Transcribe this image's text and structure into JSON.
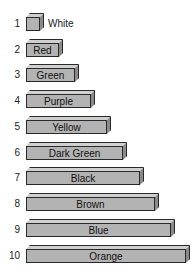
{
  "figure": {
    "items": [
      {
        "num": "1",
        "label": "White",
        "length_units": 1
      },
      {
        "num": "2",
        "label": "Red",
        "length_units": 2
      },
      {
        "num": "3",
        "label": "Green",
        "length_units": 3
      },
      {
        "num": "4",
        "label": "Purple",
        "length_units": 4
      },
      {
        "num": "5",
        "label": "Yellow",
        "length_units": 5
      },
      {
        "num": "6",
        "label": "Dark Green",
        "length_units": 6
      },
      {
        "num": "7",
        "label": "Black",
        "length_units": 7
      },
      {
        "num": "8",
        "label": "Brown",
        "length_units": 8
      },
      {
        "num": "9",
        "label": "Blue",
        "length_units": 9
      },
      {
        "num": "10",
        "label": "Orange",
        "length_units": 10
      }
    ]
  },
  "colors": {
    "bar_front": "#b3b3b3",
    "bar_top": "#d0d0d0",
    "bar_side": "#8a8a8a",
    "outline": "#2a2a2a"
  }
}
